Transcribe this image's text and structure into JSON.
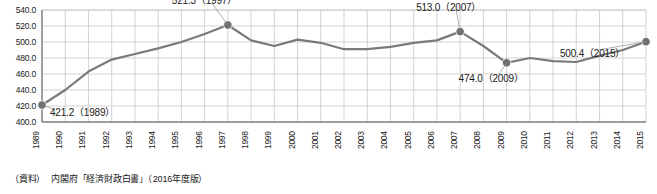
{
  "chart_data": {
    "type": "line",
    "title": "",
    "xlabel": "",
    "ylabel": "",
    "ylim": [
      400.0,
      540.0
    ],
    "ytick_labels": [
      "540.0",
      "520.0",
      "500.0",
      "480.0",
      "460.0",
      "440.0",
      "420.0",
      "400.0"
    ],
    "ytick_values": [
      540.0,
      520.0,
      500.0,
      480.0,
      460.0,
      440.0,
      420.0,
      400.0
    ],
    "grid": "horizontal-and-vertical",
    "legend": "none",
    "categories": [
      "1989",
      "1990",
      "1991",
      "1992",
      "1993",
      "1994",
      "1995",
      "1996",
      "1997",
      "1998",
      "1999",
      "2000",
      "2001",
      "2002",
      "2003",
      "2004",
      "2005",
      "2006",
      "2007",
      "2008",
      "2009",
      "2010",
      "2011",
      "2012",
      "2013",
      "2014",
      "2015"
    ],
    "values": [
      421.2,
      440.0,
      463.0,
      478.0,
      485.0,
      492.0,
      500.0,
      510.0,
      521.3,
      502.0,
      495.0,
      503.0,
      499.0,
      491.0,
      491.0,
      494.0,
      499.0,
      502.0,
      513.0,
      495.0,
      474.0,
      480.0,
      476.0,
      475.0,
      483.0,
      490.0,
      500.4
    ],
    "annotations": [
      {
        "label": "421.2（1989）",
        "year": "1989",
        "value": 421.2
      },
      {
        "label": "521.3（1997）",
        "year": "1997",
        "value": 521.3
      },
      {
        "label": "513.0（2007）",
        "year": "2007",
        "value": 513.0
      },
      {
        "label": "474.0（2009）",
        "year": "2009",
        "value": 474.0
      },
      {
        "label": "500.4（2015）",
        "year": "2015",
        "value": 500.4
      }
    ],
    "marker_years": [
      "1989",
      "1997",
      "2007",
      "2009",
      "2015"
    ],
    "line_color": "#7a7a7a",
    "marker_color": "#6e6e6e",
    "grid_color": "#c8c8c8",
    "axis_color": "#555555"
  },
  "footer": {
    "source_label": "（資料）",
    "source_text": "内閣府「経済財政白書」（2016年度版）"
  }
}
